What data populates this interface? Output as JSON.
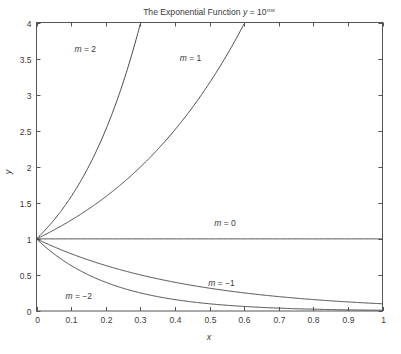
{
  "chart_data": {
    "type": "line",
    "title_parts": {
      "prefix": "The Exponential Function ",
      "var_y": "y",
      "equals": " = 10",
      "exponent": "mx"
    },
    "xlabel": "x",
    "ylabel": "y",
    "xlim": [
      0,
      1
    ],
    "ylim": [
      0,
      4
    ],
    "grid": false,
    "legend_position": "inline-labels",
    "xticks": [
      "0",
      "0.1",
      "0.2",
      "0.3",
      "0.4",
      "0.5",
      "0.6",
      "0.7",
      "0.8",
      "0.9",
      "1"
    ],
    "xtick_values": [
      0,
      0.1,
      0.2,
      0.3,
      0.4,
      0.5,
      0.6,
      0.7,
      0.8,
      0.9,
      1
    ],
    "yticks": [
      "0",
      "0.5",
      "1",
      "1.5",
      "2",
      "2.5",
      "3",
      "3.5",
      "4"
    ],
    "ytick_values": [
      0,
      0.5,
      1,
      1.5,
      2,
      2.5,
      3,
      3.5,
      4
    ],
    "formula": "y = 10^(m*x)",
    "series": [
      {
        "name": "m = 2",
        "m": 2,
        "label": "m = 2",
        "label_m": "m",
        "label_rest": " = 2",
        "label_x": 0.141,
        "label_y": 3.585,
        "points_x": [
          0,
          0.05,
          0.1,
          0.15,
          0.2,
          0.25,
          0.301
        ],
        "points_y": [
          1.0,
          1.259,
          1.585,
          1.995,
          2.512,
          3.162,
          4.0
        ]
      },
      {
        "name": "m = 1",
        "m": 1,
        "label": "m = 1",
        "label_m": "m",
        "label_rest": " = 1",
        "label_x": 0.445,
        "label_y": 3.47,
        "points_x": [
          0,
          0.1,
          0.2,
          0.3,
          0.4,
          0.5,
          0.602
        ],
        "points_y": [
          1.0,
          1.259,
          1.585,
          1.995,
          2.512,
          3.162,
          4.0
        ]
      },
      {
        "name": "m = 0",
        "m": 0,
        "label": "m = 0",
        "label_m": "m",
        "label_rest": " = 0",
        "label_x": 0.545,
        "label_y": 1.175,
        "points_x": [
          0,
          0.25,
          0.5,
          0.75,
          1.0
        ],
        "points_y": [
          1.0,
          1.0,
          1.0,
          1.0,
          1.0
        ]
      },
      {
        "name": "m = -1",
        "m": -1,
        "label": "m = −1",
        "label_m": "m",
        "label_rest": " = −1",
        "label_x": 0.535,
        "label_y": 0.345,
        "points_x": [
          0,
          0.1,
          0.2,
          0.3,
          0.4,
          0.5,
          0.6,
          0.7,
          0.8,
          0.9,
          1.0
        ],
        "points_y": [
          1.0,
          0.794,
          0.631,
          0.501,
          0.398,
          0.316,
          0.251,
          0.2,
          0.158,
          0.126,
          0.1
        ]
      },
      {
        "name": "m = -2",
        "m": -2,
        "label": "m = −2",
        "label_m": "m",
        "label_rest": " = −2",
        "label_x": 0.122,
        "label_y": 0.165,
        "points_x": [
          0,
          0.1,
          0.2,
          0.3,
          0.4,
          0.5,
          0.6,
          0.7,
          0.8,
          0.9,
          1.0
        ],
        "points_y": [
          1.0,
          0.631,
          0.398,
          0.251,
          0.158,
          0.1,
          0.063,
          0.04,
          0.025,
          0.016,
          0.01
        ]
      }
    ],
    "colors": {
      "curve": "#4a4a4a",
      "axis": "#555555",
      "text": "#3a3a3a",
      "background": "#ffffff"
    }
  }
}
